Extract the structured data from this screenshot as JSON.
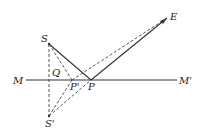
{
  "diagram": {
    "colors": {
      "line": "#333333",
      "text": "#222222",
      "background": "#ffffff"
    },
    "points": {
      "S": {
        "label": "S",
        "x": 49,
        "y": 44
      },
      "S_prime": {
        "label": "S'",
        "x": 49,
        "y": 116
      },
      "Q": {
        "label": "Q",
        "x": 49,
        "y": 80
      },
      "P": {
        "label": "P",
        "x": 91,
        "y": 80
      },
      "P_prime": {
        "label": "P'",
        "x": 72,
        "y": 80
      },
      "E": {
        "label": "E",
        "x": 167,
        "y": 18
      },
      "M": {
        "label": "M",
        "x": 26,
        "y": 80
      },
      "M_prime": {
        "label": "M'",
        "x": 177,
        "y": 80
      }
    },
    "segments": [
      {
        "from": "M",
        "to": "M_prime",
        "style": "solid"
      },
      {
        "from": "S",
        "to": "P",
        "style": "solid"
      },
      {
        "from": "P",
        "to": "E",
        "style": "solid"
      },
      {
        "from": "S",
        "to": "S_prime",
        "style": "dashed"
      },
      {
        "from": "S",
        "to": "P_prime",
        "style": "dashed"
      },
      {
        "from": "P_prime",
        "to": "E",
        "style": "dashed"
      },
      {
        "from": "S_prime",
        "to": "P_prime",
        "style": "dashed"
      },
      {
        "from": "S_prime",
        "to": "P",
        "style": "dashed"
      }
    ]
  }
}
